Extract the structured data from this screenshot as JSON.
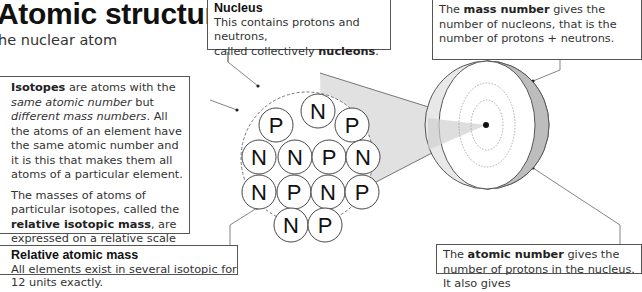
{
  "header": {
    "title": "Atomic structure:",
    "subtitle": "he nuclear atom"
  },
  "nucleus_box": {
    "heading": "Nucleus",
    "text_1": "This contains protons and neutrons,",
    "text_2": "called collectively ",
    "bold": "nucleons",
    "end": "."
  },
  "mass_number_box": {
    "pre": "The ",
    "bold": "mass number",
    "post": " gives the number of nucleons, that is the number of protons + neutrons."
  },
  "isotopes_box": {
    "bold": "Isotopes",
    "t1": " are atoms with the ",
    "i1": "same atomic number",
    "t2": " but ",
    "i2": "different mass numbers",
    "t3": ". All the atoms of an element have the same atomic number and it is this that makes them all atoms of a particular element.",
    "p2_pre": "The masses of atoms of particular isotopes, called the ",
    "p2_bold": "relative isotopic mass",
    "p2_post": ", are expressed on a relative scale on which the mass of an atom of the isotope carbon-12 has 12 units exactly."
  },
  "relative_atomic_mass_box": {
    "heading": "Relative atomic mass",
    "text": "All elements exist in several isotopic forms and it is useful to have an average value"
  },
  "atomic_number_box": {
    "pre": "The ",
    "bold": "atomic number",
    "post": " gives the number of protons in the nucleus. It also gives"
  },
  "nucleons": [
    "P",
    "N",
    "P",
    "N",
    "N",
    "P",
    "N",
    "N",
    "P",
    "N",
    "P",
    "N",
    "P"
  ]
}
